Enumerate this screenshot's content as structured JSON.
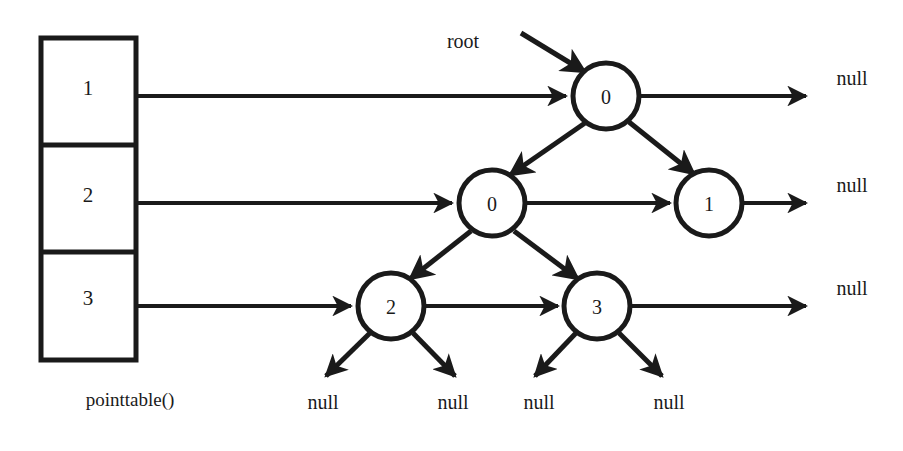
{
  "diagram": {
    "title_label": "pointtable()",
    "root_label": "root",
    "table": {
      "name": "pointtable",
      "cells": [
        {
          "value": "1"
        },
        {
          "value": "2"
        },
        {
          "value": "3"
        }
      ]
    },
    "nodes": [
      {
        "id": "n-root",
        "value": "0",
        "cx": 606,
        "cy": 96,
        "r": 33
      },
      {
        "id": "n-row2a",
        "value": "0",
        "cx": 492,
        "cy": 203,
        "r": 33
      },
      {
        "id": "n-row2b",
        "value": "1",
        "cx": 709,
        "cy": 203,
        "r": 33
      },
      {
        "id": "n-row3a",
        "value": "2",
        "cx": 391,
        "cy": 306,
        "r": 33
      },
      {
        "id": "n-row3b",
        "value": "3",
        "cx": 597,
        "cy": 306,
        "r": 33
      }
    ],
    "null_labels_right": [
      {
        "text": "null",
        "x": 852,
        "y": 78
      },
      {
        "text": "null",
        "x": 852,
        "y": 185
      },
      {
        "text": "null",
        "x": 852,
        "y": 288
      }
    ],
    "null_labels_bottom": [
      {
        "text": "null",
        "x": 323,
        "y": 402
      },
      {
        "text": "null",
        "x": 453,
        "y": 402
      },
      {
        "text": "null",
        "x": 539,
        "y": 402
      },
      {
        "text": "null",
        "x": 669,
        "y": 402
      }
    ],
    "colors": {
      "stroke": "#1a1a1a",
      "fill": "#ffffff",
      "text": "#1a1a1a"
    }
  }
}
